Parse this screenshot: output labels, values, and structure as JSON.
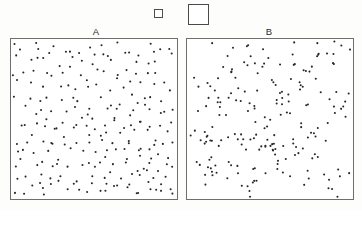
{
  "figure": {
    "title": "",
    "background_color": "#fdfdfc",
    "panel_border_color": "#6e6e6e",
    "dot_color": "#262626"
  },
  "legend": {
    "name": "quadrat-size-legend",
    "items": [
      {
        "name": "small-quadrat",
        "label": "",
        "size_px": 9,
        "border_color": "#4d4d4d"
      },
      {
        "name": "large-quadrat",
        "label": "",
        "size_px": 21,
        "border_color": "#4a4a4a"
      }
    ]
  },
  "panels": [
    {
      "id": "A",
      "label": "A",
      "pattern": "random",
      "point_count": 244,
      "x_range": [
        0,
        100
      ],
      "y_range": [
        0,
        100
      ]
    },
    {
      "id": "B",
      "label": "B",
      "pattern": "clustered",
      "point_count": 208,
      "x_range": [
        0,
        100
      ],
      "y_range": [
        0,
        100
      ]
    }
  ],
  "chart_data": [
    {
      "type": "scatter",
      "title": "A",
      "xlabel": "",
      "ylabel": "",
      "xlim": [
        0,
        100
      ],
      "ylim": [
        0,
        100
      ],
      "grid": false,
      "legend_position": "none",
      "series": [
        {
          "name": "random-points",
          "marker": "dot",
          "color": "#262626",
          "x": [
            2.1,
            4.4,
            7.9,
            11.2,
            13.6,
            16.0,
            18.4,
            21.7,
            24.8,
            27.0,
            29.9,
            32.6,
            35.1,
            38.4,
            41.0,
            43.6,
            46.2,
            49.0,
            51.5,
            54.3,
            57.0,
            59.8,
            62.4,
            65.0,
            67.9,
            70.2,
            73.0,
            75.8,
            78.4,
            81.0,
            83.8,
            86.4,
            89.0,
            91.8,
            94.4,
            97.0,
            1.5,
            5.2,
            9.1,
            12.4,
            15.0,
            19.2,
            22.6,
            25.4,
            28.1,
            31.5,
            34.2,
            37.0,
            40.1,
            42.8,
            45.5,
            48.2,
            50.9,
            53.6,
            56.4,
            59.0,
            61.8,
            64.5,
            67.2,
            70.0,
            72.7,
            75.4,
            78.1,
            80.8,
            83.5,
            86.2,
            88.9,
            91.6,
            94.3,
            97.8,
            3.2,
            6.5,
            10.0,
            13.0,
            16.5,
            20.0,
            23.4,
            26.2,
            29.0,
            32.0,
            35.6,
            38.0,
            41.5,
            44.2,
            47.0,
            50.2,
            53.0,
            55.8,
            58.5,
            61.2,
            64.0,
            66.8,
            69.5,
            72.2,
            75.0,
            77.8,
            80.5,
            83.2,
            86.0,
            88.8,
            91.5,
            94.2,
            96.9,
            2.7,
            5.9,
            8.8,
            12.0,
            15.4,
            18.8,
            21.2,
            24.0,
            27.6,
            30.4,
            33.2,
            36.0,
            39.2,
            42.0,
            45.0,
            47.8,
            50.6,
            53.4,
            56.0,
            58.8,
            61.6,
            64.4,
            67.0,
            69.8,
            72.5,
            75.2,
            78.0,
            80.6,
            83.4,
            86.6,
            89.4,
            92.2,
            95.0,
            98.2,
            1.8,
            4.9,
            8.2,
            11.6,
            14.8,
            17.5,
            20.8,
            23.8,
            26.6,
            29.4,
            32.8,
            36.5,
            39.8,
            43.0,
            46.8,
            49.6,
            52.4,
            55.2,
            58.0,
            60.6,
            63.4,
            66.2,
            69.0,
            71.8,
            74.6,
            77.4,
            80.2,
            82.8,
            85.6,
            88.4,
            91.0,
            93.8,
            96.5,
            99.0,
            3.8,
            7.2,
            10.8,
            14.2,
            17.0,
            20.4,
            23.0,
            26.0,
            28.6,
            31.0,
            34.8,
            37.6,
            40.6,
            44.8,
            47.4,
            51.0,
            54.8,
            57.6,
            60.2,
            63.0,
            65.8,
            68.6,
            71.4,
            74.2,
            77.0,
            79.8,
            82.4,
            85.0,
            87.8,
            90.6,
            93.4,
            96.2,
            99.4,
            2.4,
            6.0,
            9.6,
            13.4,
            16.8,
            19.6,
            22.2,
            25.0,
            30.8,
            33.8,
            37.2,
            40.8,
            43.4,
            46.6,
            49.2,
            52.0,
            55.6,
            58.2,
            62.0,
            66.4,
            70.6,
            73.6,
            76.4,
            79.0,
            81.6,
            84.2,
            87.2,
            90.0,
            92.6,
            95.6,
            98.6
          ],
          "y": [
            97.5,
            92.0,
            95.3,
            88.4,
            96.1,
            90.2,
            93.0,
            86.5,
            91.4,
            97.8,
            84.6,
            89.9,
            94.2,
            87.3,
            92.8,
            85.0,
            96.6,
            90.8,
            83.2,
            94.8,
            88.0,
            91.2,
            86.2,
            95.8,
            89.4,
            82.6,
            93.6,
            87.6,
            91.8,
            85.4,
            96.2,
            90.4,
            84.0,
            92.4,
            88.6,
            95.0,
            79.8,
            76.4,
            81.2,
            74.0,
            78.6,
            72.2,
            80.4,
            75.6,
            69.8,
            77.2,
            73.4,
            81.6,
            70.6,
            76.8,
            68.4,
            74.8,
            79.2,
            71.0,
            77.6,
            66.2,
            73.8,
            80.0,
            69.2,
            75.0,
            67.6,
            78.2,
            71.6,
            64.8,
            76.2,
            70.2,
            79.6,
            73.0,
            66.8,
            74.4,
            62.4,
            58.0,
            63.6,
            55.2,
            60.8,
            57.4,
            61.2,
            54.0,
            59.6,
            52.6,
            63.0,
            56.6,
            61.8,
            53.2,
            58.4,
            50.8,
            62.8,
            55.8,
            59.0,
            51.4,
            57.0,
            60.4,
            53.8,
            56.2,
            62.0,
            50.2,
            58.8,
            54.6,
            61.4,
            52.0,
            59.8,
            55.4,
            57.8,
            46.2,
            44.0,
            48.6,
            41.4,
            47.0,
            43.2,
            49.4,
            45.0,
            42.6,
            48.0,
            40.2,
            46.8,
            43.8,
            49.8,
            41.0,
            47.6,
            44.6,
            39.6,
            46.0,
            42.2,
            48.4,
            40.8,
            45.6,
            38.4,
            47.2,
            43.0,
            49.0,
            41.8,
            44.2,
            38.0,
            46.4,
            42.8,
            45.8,
            34.8,
            31.0,
            36.4,
            29.2,
            33.6,
            30.4,
            35.8,
            28.0,
            32.8,
            36.8,
            26.6,
            34.2,
            30.0,
            35.0,
            27.8,
            33.0,
            29.8,
            36.2,
            25.4,
            31.8,
            34.6,
            28.6,
            32.2,
            26.0,
            35.4,
            30.6,
            33.8,
            27.2,
            31.4,
            24.8,
            34.0,
            29.0,
            32.6,
            26.8,
            20.4,
            18.0,
            22.6,
            15.2,
            21.0,
            17.4,
            23.2,
            14.0,
            19.6,
            22.0,
            16.6,
            20.8,
            13.4,
            18.8,
            21.6,
            15.8,
            19.0,
            23.8,
            12.8,
            17.0,
            20.2,
            14.6,
            22.4,
            16.0,
            19.4,
            13.0,
            21.4,
            17.8,
            23.6,
            15.0,
            18.4,
            12.2,
            20.0,
            9.4,
            6.0,
            10.6,
            4.2,
            8.8,
            5.4,
            11.2,
            3.0,
            7.6,
            9.0,
            5.8,
            10.0,
            2.6,
            8.2,
            6.6,
            11.6,
            4.6,
            9.8,
            3.4,
            7.0,
            10.8,
            5.0,
            8.4,
            2.2,
            6.2,
            9.2,
            4.0,
            7.8,
            11.0,
            3.6,
            5.6,
            8.6
          ]
        }
      ]
    },
    {
      "type": "scatter",
      "title": "B",
      "xlabel": "",
      "ylabel": "",
      "xlim": [
        0,
        100
      ],
      "ylim": [
        0,
        100
      ],
      "grid": false,
      "legend_position": "none",
      "series": [
        {
          "name": "clustered-points",
          "marker": "dot",
          "color": "#262626",
          "cluster_centers": [
            [
              30,
              88
            ],
            [
              9,
              76
            ],
            [
              52,
              82
            ],
            [
              88,
              92
            ],
            [
              72,
              78
            ],
            [
              12,
              56
            ],
            [
              35,
              60
            ],
            [
              60,
              62
            ],
            [
              92,
              58
            ],
            [
              22,
              40
            ],
            [
              48,
              42
            ],
            [
              78,
              38
            ],
            [
              15,
              18
            ],
            [
              38,
              14
            ],
            [
              62,
              20
            ],
            [
              88,
              12
            ],
            [
              55,
              32
            ],
            [
              5,
              34
            ]
          ],
          "cluster_spread": 6.5
        }
      ]
    }
  ]
}
